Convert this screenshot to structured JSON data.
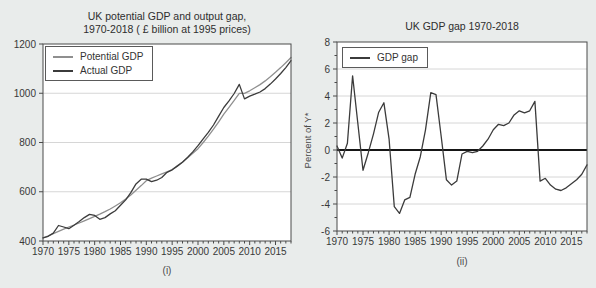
{
  "colors": {
    "background": "#e9eceb",
    "plot_bg": "#ffffff",
    "axis": "#4a4a4a",
    "grid": "#d6d6d6",
    "zero_line": "#161616",
    "potential_line": "#8f8f8f",
    "actual_line": "#3b3b3b",
    "gap_line": "#3b3b3b"
  },
  "chart_data": [
    {
      "type": "line",
      "title_lines": [
        "UK potential GDP and output gap,",
        "1970-2018 ( £ billion at 1995 prices)"
      ],
      "caption": "(i)",
      "x_start": 1970,
      "x_end": 2018,
      "xticks": [
        1970,
        1975,
        1980,
        1985,
        1990,
        1995,
        2000,
        2005,
        2010,
        2015
      ],
      "ylim": [
        400,
        1200
      ],
      "yticks": [
        400,
        600,
        800,
        1000,
        1200
      ],
      "grid": true,
      "legend_position": "top-left",
      "series": [
        {
          "name": "Potential GDP",
          "color": "#8f8f8f",
          "values": [
            412,
            421,
            430,
            439,
            448,
            457,
            465,
            473,
            482,
            491,
            500,
            509,
            519,
            530,
            542,
            555,
            570,
            587,
            606,
            625,
            645,
            655,
            664,
            673,
            681,
            690,
            705,
            721,
            738,
            756,
            775,
            800,
            826,
            854,
            884,
            915,
            943,
            971,
            1000,
            1000,
            1010,
            1022,
            1035,
            1050,
            1067,
            1085,
            1104,
            1124,
            1145
          ]
        },
        {
          "name": "Actual GDP",
          "color": "#3b3b3b",
          "values": [
            413,
            419,
            432,
            463,
            457,
            450,
            464,
            479,
            495,
            508,
            504,
            488,
            495,
            510,
            523,
            545,
            567,
            596,
            632,
            651,
            651,
            641,
            647,
            658,
            679,
            689,
            704,
            720,
            740,
            762,
            787,
            815,
            841,
            871,
            907,
            942,
            969,
            999,
            1036,
            977,
            988,
            996,
            1005,
            1019,
            1037,
            1058,
            1080,
            1104,
            1132
          ]
        }
      ]
    },
    {
      "type": "line",
      "title_lines": [
        "UK GDP gap 1970-2018"
      ],
      "caption": "(ii)",
      "ylabel": "Percent of Y*",
      "x_start": 1970,
      "x_end": 2018,
      "xticks": [
        1970,
        1975,
        1980,
        1985,
        1990,
        1995,
        2000,
        2005,
        2010,
        2015
      ],
      "ylim": [
        -6,
        8
      ],
      "yticks": [
        -6,
        -4,
        -2,
        0,
        2,
        4,
        6,
        8
      ],
      "y_minor_step": 1,
      "grid": true,
      "zero_line": true,
      "legend_position": "top-left",
      "series": [
        {
          "name": "GDP gap",
          "color": "#3b3b3b",
          "values": [
            0.3,
            -0.6,
            0.5,
            5.5,
            2.0,
            -1.5,
            -0.2,
            1.2,
            2.8,
            3.5,
            0.8,
            -4.2,
            -4.7,
            -3.7,
            -3.5,
            -1.8,
            -0.5,
            1.5,
            4.25,
            4.1,
            1.0,
            -2.2,
            -2.6,
            -2.3,
            -0.3,
            -0.1,
            -0.2,
            -0.1,
            0.3,
            0.8,
            1.5,
            1.9,
            1.8,
            2.0,
            2.6,
            2.9,
            2.75,
            2.9,
            3.6,
            -2.3,
            -2.1,
            -2.6,
            -2.9,
            -3.0,
            -2.8,
            -2.5,
            -2.2,
            -1.8,
            -1.1
          ]
        }
      ]
    }
  ]
}
